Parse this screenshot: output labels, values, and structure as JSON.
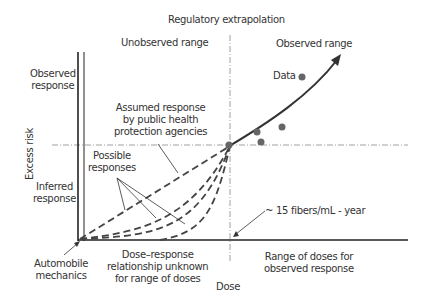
{
  "diagram": {
    "title": "Regulatory extrapolation",
    "regions": {
      "unobserved": "Unobserved range",
      "observed": "Observed range"
    },
    "y_axis": {
      "label": "Excess risk",
      "observed_response": [
        "Observed",
        "response"
      ],
      "inferred_response": [
        "Inferred",
        "response"
      ]
    },
    "x_axis": {
      "label": "Dose",
      "origin_label": [
        "Automobile",
        "mechanics"
      ],
      "unknown_range": [
        "Dose–response",
        "relationship unknown",
        "for range of doses"
      ],
      "observed_doses": [
        "Range of doses for",
        "observed response"
      ],
      "threshold": "~ 15 fibers/mL - year"
    },
    "annotations": {
      "assumed_response": [
        "Assumed response",
        "by public health",
        "protection agencies"
      ],
      "possible_responses": [
        "Possible",
        "responses"
      ],
      "data": "Data"
    },
    "colors": {
      "line": "#333333",
      "dashed": "#444444",
      "data_point": "#666666",
      "guide": "#888888"
    },
    "data_points": [
      {
        "x": 257,
        "y": 132
      },
      {
        "x": 261,
        "y": 142
      },
      {
        "x": 282,
        "y": 127
      },
      {
        "x": 302,
        "y": 77
      }
    ]
  }
}
